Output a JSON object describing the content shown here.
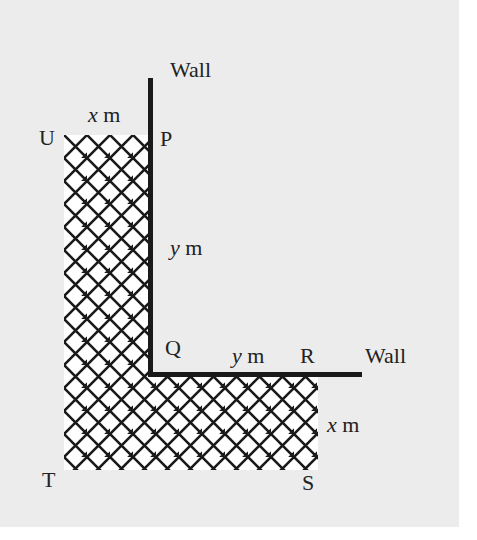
{
  "diagram": {
    "walls": [
      {
        "label": "Wall",
        "orientation": "vertical"
      },
      {
        "label": "Wall",
        "orientation": "horizontal"
      }
    ],
    "points": {
      "U": "U",
      "P": "P",
      "Q": "Q",
      "R": "R",
      "S": "S",
      "T": "T"
    },
    "dimensions": {
      "up_width_var": "x",
      "up_width_unit": "m",
      "pq_var": "y",
      "pq_unit": "m",
      "qr_var": "y",
      "qr_unit": "m",
      "rs_var": "x",
      "rs_unit": "m"
    },
    "colors": {
      "background": "#ececec",
      "ink": "#1a1a1a",
      "hatch_fill": "#ffffff"
    }
  }
}
